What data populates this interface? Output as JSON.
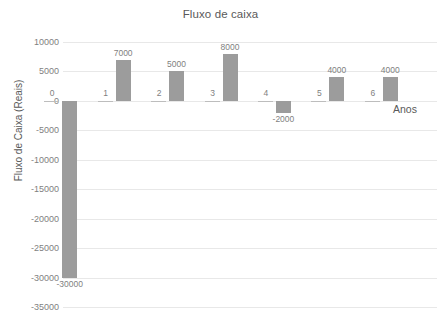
{
  "chart_data": {
    "type": "bar",
    "title": "Fluxo de caixa",
    "xlabel": "Anos",
    "ylabel": "Fluxo de Caixa (Reais)",
    "categories": [
      "0",
      "1",
      "2",
      "3",
      "4",
      "5",
      "6"
    ],
    "values": [
      -30000,
      7000,
      5000,
      8000,
      -2000,
      4000,
      4000
    ],
    "value_labels": [
      "-30000",
      "7000",
      "5000",
      "8000",
      "-2000",
      "4000",
      "4000"
    ],
    "ylim": [
      -35000,
      10000
    ],
    "ytick_labels": [
      "10000",
      "5000",
      "0",
      "-5000",
      "-10000",
      "-15000",
      "-20000",
      "-25000",
      "-30000",
      "-35000"
    ],
    "ytick_values": [
      10000,
      5000,
      0,
      -5000,
      -10000,
      -15000,
      -20000,
      -25000,
      -30000,
      -35000
    ],
    "grid": true,
    "legend": false,
    "series_color": "#9c9c9c",
    "gridline_color": "#e8e8e8",
    "text_color": "#7f7f7f",
    "background": "#ffffff"
  }
}
